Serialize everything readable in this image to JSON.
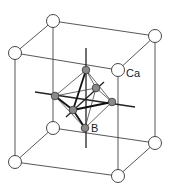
{
  "diagram": {
    "type": "crystal-structure",
    "labels": {
      "corner_atom": "Ca",
      "center_atom": "B"
    },
    "colors": {
      "line": "#333333",
      "corner_fill": "#ffffff",
      "octa_fill": "#8a8a8a"
    }
  }
}
